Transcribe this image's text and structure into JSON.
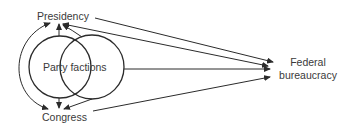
{
  "diagram": {
    "nodes": {
      "presidency": "Presidency",
      "party_factions": "Party factions",
      "congress": "Congress",
      "federal_bureaucracy_line1": "Federal",
      "federal_bureaucracy_line2": "bureaucracy"
    },
    "edges": [
      {
        "from": "Presidency",
        "to": "Congress",
        "type": "double-headed curved arrow"
      },
      {
        "from": "Party factions (left circle)",
        "to": "Presidency",
        "type": "arrow"
      },
      {
        "from": "Party factions (right circle)",
        "to": "Presidency",
        "type": "arrow"
      },
      {
        "from": "Party factions (left circle)",
        "to": "Congress",
        "type": "arrow"
      },
      {
        "from": "Party factions (right circle)",
        "to": "Congress",
        "type": "arrow"
      },
      {
        "from": "Presidency",
        "to": "Federal bureaucracy",
        "type": "arrow"
      },
      {
        "from": "Federal bureaucracy",
        "to": "Presidency",
        "type": "double-headed arrow"
      },
      {
        "from": "Party factions",
        "to": "Federal bureaucracy",
        "type": "arrow"
      },
      {
        "from": "Congress",
        "to": "Federal bureaucracy",
        "type": "arrow"
      }
    ],
    "colors": {
      "line": "#2b2b2b",
      "text": "#3a3a3a",
      "background": "#ffffff"
    }
  }
}
